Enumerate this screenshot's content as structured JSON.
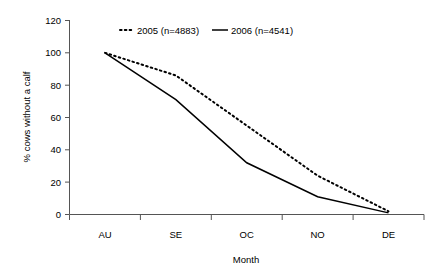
{
  "chart_data": {
    "type": "line",
    "title": "",
    "xlabel": "Month",
    "ylabel": "% cows without a calf",
    "categories": [
      "AU",
      "SE",
      "OC",
      "NO",
      "DE"
    ],
    "ylim": [
      0,
      120
    ],
    "yticks": [
      0,
      20,
      40,
      60,
      80,
      100,
      120
    ],
    "ytick_labels": [
      "0",
      "20",
      "40",
      "60",
      "80",
      "100",
      "120"
    ],
    "grid": false,
    "legend_position": "top-center",
    "series": [
      {
        "name": "2005 (n=4883)",
        "style": "dotted",
        "color": "#000000",
        "values": [
          100,
          86,
          55,
          24,
          2
        ]
      },
      {
        "name": "2006 (n=4541)",
        "style": "solid",
        "color": "#000000",
        "values": [
          100,
          71,
          32,
          11,
          1
        ]
      }
    ]
  },
  "axes": {
    "y_label": "% cows without a calf",
    "x_label": "Month",
    "y_tick_0": "0",
    "y_tick_1": "20",
    "y_tick_2": "40",
    "y_tick_3": "60",
    "y_tick_4": "80",
    "y_tick_5": "100",
    "y_tick_6": "120",
    "x_cat_0": "AU",
    "x_cat_1": "SE",
    "x_cat_2": "OC",
    "x_cat_3": "NO",
    "x_cat_4": "DE"
  },
  "legend": {
    "entry_0_label": "2005 (n=4883)",
    "entry_1_label": "2006 (n=4541)"
  }
}
